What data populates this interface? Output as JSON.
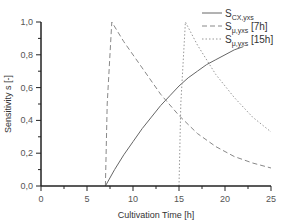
{
  "chart_data": {
    "type": "line",
    "title": "",
    "xlabel": "Cultivation Time [h]",
    "ylabel": "Sensitivity s [-]",
    "xlim": [
      0,
      25
    ],
    "ylim": [
      0,
      1.0
    ],
    "x_ticks": [
      "0",
      "5",
      "10",
      "15",
      "20",
      "25"
    ],
    "y_ticks": [
      "0,0",
      "0,2",
      "0,4",
      "0,6",
      "0,8",
      "1,0"
    ],
    "grid": false,
    "legend_position": "top-right",
    "series": [
      {
        "name": "S_CX,yxs",
        "label_main": "S",
        "label_sub": "CX,yxs",
        "label_suffix": "",
        "style": "solid",
        "color": "#666666",
        "x": [
          7,
          8,
          9,
          10,
          11,
          12,
          13,
          14,
          15,
          16,
          17,
          18,
          19,
          20,
          21,
          22
        ],
        "y": [
          0.0,
          0.1,
          0.19,
          0.27,
          0.35,
          0.42,
          0.49,
          0.55,
          0.61,
          0.66,
          0.7,
          0.74,
          0.77,
          0.8,
          0.83,
          0.85
        ]
      },
      {
        "name": "S_μ,yxs [7h]",
        "label_main": "S",
        "label_sub": "μ,yxs",
        "label_suffix": " [7h]",
        "style": "dashed",
        "color": "#888888",
        "x": [
          7,
          7.2,
          7.7,
          9,
          11,
          13,
          15,
          17,
          19,
          21,
          23,
          25
        ],
        "y": [
          0.0,
          0.5,
          1.0,
          0.88,
          0.72,
          0.56,
          0.43,
          0.32,
          0.24,
          0.18,
          0.14,
          0.11
        ]
      },
      {
        "name": "S_μ,yxs [15h]",
        "label_main": "S",
        "label_sub": "μ,yxs",
        "label_suffix": " [15h]",
        "style": "dotted",
        "color": "#999999",
        "x": [
          15,
          15.2,
          15.7,
          17,
          19,
          21,
          23,
          25
        ],
        "y": [
          0.0,
          0.5,
          1.0,
          0.86,
          0.68,
          0.54,
          0.42,
          0.33
        ]
      }
    ]
  }
}
